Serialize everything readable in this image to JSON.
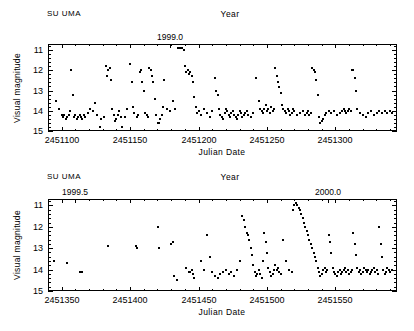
{
  "figure": {
    "object_name": "SU  UMA",
    "panels": 2,
    "point_color": "#000000",
    "background": "#ffffff"
  },
  "chart_data": [
    {
      "type": "scatter",
      "title": "",
      "panel": "top",
      "object_label": "SU  UMA",
      "xlabel": "Julian  Date",
      "ylabel": "Visual  magnitude",
      "top_axis_label": "Year",
      "top_axis_ticks": [
        {
          "label": "1999.0",
          "value": 2451179.5
        }
      ],
      "xlim": [
        2451090,
        2451345
      ],
      "ylim": [
        15.0,
        10.7
      ],
      "y_inverted": true,
      "xticks": [
        2451100,
        2451150,
        2451200,
        2451250,
        2451300
      ],
      "xticklabels": [
        "2451100",
        "2451150",
        "2451200",
        "2451250",
        "2451300"
      ],
      "yticks": [
        11,
        12,
        13,
        14,
        15
      ],
      "yticklabels": [
        "11",
        "12",
        "13",
        "14",
        "15"
      ],
      "grid": false,
      "legend": "none",
      "x": [
        2451096,
        2451098,
        2451100,
        2451101,
        2451102,
        2451103,
        2451104,
        2451105,
        2451106,
        2451107,
        2451108,
        2451109,
        2451110,
        2451111,
        2451112,
        2451113,
        2451114,
        2451115,
        2451116,
        2451117,
        2451119,
        2451121,
        2451123,
        2451124,
        2451126,
        2451128,
        2451129,
        2451131,
        2451132,
        2451133,
        2451134,
        2451135,
        2451136,
        2451137,
        2451138,
        2451139,
        2451140,
        2451141,
        2451142,
        2451143,
        2451144,
        2451146,
        2451148,
        2451150,
        2451151,
        2451152,
        2451153,
        2451155,
        2451156,
        2451157,
        2451158,
        2451159,
        2451160,
        2451161,
        2451162,
        2451163,
        2451164,
        2451165,
        2451166,
        2451167,
        2451168,
        2451169,
        2451170,
        2451171,
        2451172,
        2451173,
        2451174,
        2451175,
        2451177,
        2451179,
        2451181,
        2451183,
        2451185,
        2451186,
        2451187,
        2451188,
        2451189,
        2451190,
        2451191,
        2451192,
        2451193,
        2451194,
        2451195,
        2451196,
        2451197,
        2451198,
        2451199,
        2451200,
        2451202,
        2451204,
        2451206,
        2451208,
        2451210,
        2451212,
        2451213,
        2451214,
        2451215,
        2451216,
        2451217,
        2451218,
        2451219,
        2451220,
        2451221,
        2451222,
        2451223,
        2451224,
        2451225,
        2451226,
        2451227,
        2451228,
        2451229,
        2451230,
        2451231,
        2451232,
        2451233,
        2451234,
        2451235,
        2451236,
        2451238,
        2451240,
        2451242,
        2451244,
        2451245,
        2451246,
        2451247,
        2451248,
        2451249,
        2451250,
        2451251,
        2451252,
        2451253,
        2451254,
        2451255,
        2451256,
        2451257,
        2451258,
        2451259,
        2451260,
        2451261,
        2451262,
        2451263,
        2451264,
        2451265,
        2451266,
        2451267,
        2451268,
        2451269,
        2451270,
        2451272,
        2451274,
        2451276,
        2451278,
        2451279,
        2451280,
        2451281,
        2451282,
        2451283,
        2451284,
        2451285,
        2451286,
        2451287,
        2451288,
        2451289,
        2451290,
        2451291,
        2451292,
        2451293,
        2451295,
        2451297,
        2451299,
        2451301,
        2451303,
        2451305,
        2451306,
        2451307,
        2451308,
        2451309,
        2451310,
        2451311,
        2451312,
        2451313,
        2451314,
        2451315,
        2451316,
        2451318,
        2451320,
        2451322,
        2451324,
        2451326,
        2451328,
        2451330,
        2451332,
        2451334,
        2451336,
        2451338,
        2451340,
        2451341
      ],
      "y": [
        13.5,
        13.9,
        14.2,
        14.3,
        14.2,
        14.4,
        14.3,
        14.2,
        14.0,
        12.0,
        13.2,
        14.3,
        14.2,
        14.4,
        14.3,
        14.2,
        14.3,
        14.4,
        14.2,
        14.3,
        14.1,
        13.9,
        14.0,
        13.6,
        14.2,
        14.8,
        14.4,
        14.3,
        11.8,
        12.3,
        12.0,
        11.9,
        12.5,
        13.9,
        14.2,
        14.5,
        14.4,
        14.2,
        14.0,
        14.3,
        14.8,
        14.3,
        13.9,
        11.7,
        12.6,
        13.8,
        14.1,
        14.3,
        14.2,
        12.1,
        12.0,
        12.6,
        13.0,
        14.1,
        14.2,
        14.3,
        11.9,
        12.0,
        12.3,
        12.6,
        13.4,
        14.2,
        14.6,
        14.6,
        14.4,
        14.2,
        13.8,
        12.5,
        13.9,
        14.0,
        13.5,
        13.9,
        10.9,
        10.9,
        10.9,
        10.9,
        11.0,
        11.8,
        12.1,
        12.0,
        12.2,
        12.1,
        12.3,
        12.6,
        13.3,
        13.8,
        14.1,
        14.0,
        14.2,
        13.9,
        14.1,
        14.3,
        14.0,
        12.4,
        13.0,
        13.2,
        13.9,
        14.2,
        14.3,
        14.4,
        14.1,
        13.9,
        14.0,
        14.2,
        14.3,
        14.1,
        14.0,
        14.2,
        14.3,
        14.4,
        14.2,
        14.0,
        14.1,
        14.3,
        14.2,
        14.1,
        14.0,
        14.2,
        14.3,
        14.1,
        12.4,
        13.5,
        13.9,
        14.0,
        14.1,
        13.9,
        13.7,
        14.0,
        13.9,
        14.1,
        13.8,
        14.0,
        13.9,
        11.9,
        12.3,
        12.6,
        12.8,
        13.1,
        13.7,
        13.9,
        14.0,
        14.1,
        13.9,
        14.0,
        14.2,
        14.1,
        13.9,
        14.0,
        14.2,
        14.1,
        14.0,
        14.2,
        14.1,
        14.0,
        14.2,
        14.1,
        11.9,
        12.0,
        12.1,
        12.5,
        13.2,
        14.3,
        14.6,
        14.5,
        14.4,
        14.2,
        14.1,
        14.0,
        14.1,
        14.0,
        14.2,
        14.1,
        14.0,
        13.9,
        14.0,
        14.1,
        14.0,
        13.9,
        14.0,
        12.0,
        12.0,
        12.4,
        13.0,
        13.9,
        14.1,
        14.2,
        14.3,
        14.1,
        14.0,
        14.2,
        14.1,
        14.0,
        14.1,
        14.0,
        14.1,
        14.0,
        14.1,
        14.0,
        11.9,
        12.5,
        13.4,
        14.0
      ]
    },
    {
      "type": "scatter",
      "title": "",
      "panel": "bottom",
      "object_label": "SU  UMA",
      "xlabel": "Julian  Date",
      "ylabel": "Visual  magnitude",
      "top_axis_label": "Year",
      "top_axis_ticks": [
        {
          "label": "1999.5",
          "value": 2451360.0
        },
        {
          "label": "2000.0",
          "value": 2451544.5
        }
      ],
      "xlim": [
        2451340,
        2451595
      ],
      "ylim": [
        15.0,
        10.7
      ],
      "y_inverted": true,
      "xticks": [
        2451350,
        2451400,
        2451450,
        2451500,
        2451550
      ],
      "xticklabels": [
        "2451350",
        "2451400",
        "2451450",
        "2451500",
        "2451550"
      ],
      "yticks": [
        11,
        12,
        13,
        14,
        15
      ],
      "yticklabels": [
        "11",
        "12",
        "13",
        "14",
        "15"
      ],
      "grid": false,
      "legend": "none",
      "x": [
        2451344,
        2451354,
        2451363,
        2451365,
        2451384,
        2451404,
        2451405,
        2451420,
        2451421,
        2451430,
        2451431,
        2451432,
        2451434,
        2451441,
        2451443,
        2451444,
        2451445,
        2451446,
        2451447,
        2451452,
        2451454,
        2451456,
        2451458,
        2451460,
        2451462,
        2451464,
        2451466,
        2451468,
        2451470,
        2451472,
        2451474,
        2451476,
        2451478,
        2451480,
        2451482,
        2451483,
        2451484,
        2451485,
        2451486,
        2451487,
        2451488,
        2451489,
        2451490,
        2451491,
        2451492,
        2451493,
        2451494,
        2451495,
        2451496,
        2451497,
        2451498,
        2451499,
        2451500,
        2451501,
        2451502,
        2451503,
        2451504,
        2451505,
        2451506,
        2451507,
        2451508,
        2451509,
        2451510,
        2451512,
        2451514,
        2451516,
        2451518,
        2451519,
        2451520,
        2451521,
        2451522,
        2451523,
        2451524,
        2451525,
        2451526,
        2451527,
        2451528,
        2451529,
        2451530,
        2451531,
        2451532,
        2451533,
        2451534,
        2451535,
        2451536,
        2451537,
        2451538,
        2451539,
        2451540,
        2451541,
        2451542,
        2451543,
        2451544,
        2451545,
        2451546,
        2451547,
        2451548,
        2451549,
        2451550,
        2451551,
        2451552,
        2451553,
        2451554,
        2451555,
        2451556,
        2451557,
        2451558,
        2451559,
        2451560,
        2451561,
        2451562,
        2451563,
        2451564,
        2451565,
        2451566,
        2451567,
        2451568,
        2451569,
        2451570,
        2451571,
        2451572,
        2451573,
        2451574,
        2451575,
        2451576,
        2451577,
        2451578,
        2451579,
        2451580,
        2451581,
        2451582,
        2451583,
        2451584,
        2451585,
        2451586,
        2451587,
        2451588,
        2451589,
        2451590,
        2451591
      ],
      "y": [
        13.6,
        13.7,
        14.1,
        14.1,
        12.9,
        12.9,
        13.0,
        12.0,
        13.0,
        12.8,
        12.7,
        14.3,
        14.5,
        13.9,
        14.1,
        14.1,
        14.0,
        14.2,
        14.4,
        13.6,
        14.0,
        12.4,
        13.4,
        14.1,
        14.3,
        14.4,
        14.2,
        14.1,
        14.0,
        14.2,
        14.1,
        14.3,
        14.0,
        13.6,
        11.5,
        11.7,
        12.0,
        12.3,
        12.4,
        12.6,
        13.0,
        13.3,
        13.8,
        14.1,
        14.3,
        14.2,
        14.0,
        14.2,
        14.4,
        13.6,
        12.3,
        12.7,
        13.2,
        13.9,
        14.1,
        14.3,
        14.2,
        14.0,
        13.8,
        14.0,
        13.9,
        14.1,
        14.2,
        12.6,
        13.6,
        14.0,
        14.1,
        11.2,
        11.0,
        10.9,
        11.0,
        11.1,
        11.2,
        11.4,
        11.6,
        11.8,
        12.0,
        12.2,
        12.4,
        12.6,
        12.8,
        13.0,
        13.2,
        13.4,
        13.6,
        13.9,
        14.1,
        14.3,
        14.2,
        14.0,
        13.9,
        14.1,
        14.0,
        12.4,
        12.7,
        13.2,
        13.9,
        14.1,
        14.2,
        14.3,
        14.1,
        14.0,
        14.2,
        14.1,
        14.0,
        13.9,
        14.1,
        14.0,
        14.2,
        14.1,
        14.0,
        12.3,
        12.8,
        13.3,
        13.9,
        14.1,
        14.0,
        14.2,
        14.1,
        13.9,
        14.0,
        14.1,
        14.0,
        14.2,
        14.1,
        14.0,
        13.9,
        14.1,
        14.0,
        14.2,
        12.0,
        12.8,
        13.4,
        14.0,
        14.2,
        14.1,
        13.9,
        14.0,
        14.1,
        14.0
      ]
    }
  ]
}
